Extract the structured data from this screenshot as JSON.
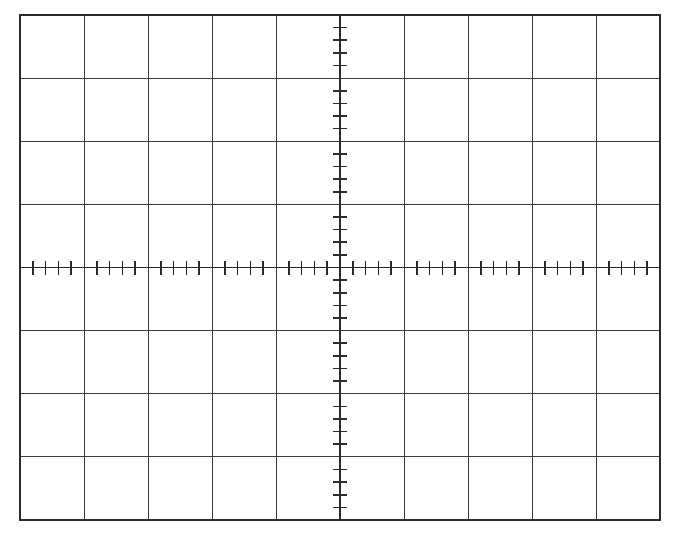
{
  "figure": {
    "type": "oscilloscope-graticule",
    "background_color": "#ffffff",
    "canvas": {
      "width": 687,
      "height": 542
    }
  },
  "chart_data": {
    "type": "grid",
    "xlabel": "",
    "ylabel": "",
    "grid": true,
    "legend": "none",
    "annotations": [],
    "plot_area": {
      "left": 20,
      "top": 15,
      "right": 660,
      "bottom": 520,
      "width": 640,
      "height": 505
    },
    "divisions": {
      "horizontal_count": 10,
      "vertical_count": 8,
      "horizontal_step_px": 64,
      "vertical_step_px": 63.125
    },
    "axes": {
      "center_x_px": 340,
      "center_y_px": 267.5,
      "xlim": [
        -5,
        5
      ],
      "ylim": [
        -4,
        4
      ],
      "x_major_ticks": [
        -5,
        -4,
        -3,
        -2,
        -1,
        0,
        1,
        2,
        3,
        4,
        5
      ],
      "y_major_ticks": [
        -4,
        -3,
        -2,
        -1,
        0,
        1,
        2,
        3,
        4
      ],
      "minor_ticks_per_division": 5,
      "minor_tick_length_px": 14,
      "minor_tick_width_px": 1.6
    },
    "style": {
      "grid_line_color": "#3b3b3b",
      "grid_line_width_px": 1,
      "border_line_color": "#2b2b2b",
      "border_line_width_px": 1.6,
      "axis_line_color": "#2b2b2b",
      "axis_line_width_px": 1.4,
      "tick_color": "#2b2b2b"
    },
    "categories": [],
    "values": [],
    "series": []
  }
}
